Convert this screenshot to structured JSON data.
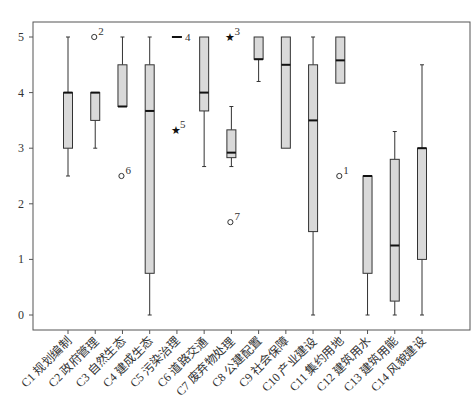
{
  "chart_data": {
    "type": "boxplot",
    "title": "",
    "xlabel": "",
    "ylabel": "",
    "ylim": [
      0,
      5
    ],
    "yticks": [
      0,
      1,
      2,
      3,
      4,
      5
    ],
    "grid": false,
    "legend": null,
    "categories": [
      "C1 规划编制",
      "C2 政府管理",
      "C3 自然生态",
      "C4 建成生态",
      "C5 污染治理",
      "C6 道路交通",
      "C7 废弃物处理",
      "C8 公建配置",
      "C9 社会保障",
      "C10 产业建设",
      "C11 集约用地",
      "C12 建筑用水",
      "C13 建筑用能",
      "C14 风貌建设"
    ],
    "boxes": [
      {
        "min": 2.5,
        "q1": 3.0,
        "median": 4.0,
        "q3": 4.0,
        "max": 5.0,
        "outliers": []
      },
      {
        "min": 3.0,
        "q1": 3.5,
        "median": 4.0,
        "q3": 4.0,
        "max": 4.0,
        "outliers": [
          {
            "value": 5.0,
            "marker": "circle",
            "label": "2"
          }
        ]
      },
      {
        "min": 3.75,
        "q1": 3.75,
        "median": 3.75,
        "q3": 4.5,
        "max": 5.0,
        "outliers": [
          {
            "value": 2.5,
            "marker": "circle",
            "label": "6"
          }
        ]
      },
      {
        "min": 0.0,
        "q1": 0.75,
        "median": 3.67,
        "q3": 4.5,
        "max": 5.0,
        "outliers": []
      },
      {
        "min": 5.0,
        "q1": 5.0,
        "median": 5.0,
        "q3": 5.0,
        "max": 5.0,
        "label": "4",
        "outliers": [
          {
            "value": 3.33,
            "marker": "star",
            "label": "5"
          }
        ]
      },
      {
        "min": 2.67,
        "q1": 3.67,
        "median": 4.0,
        "q3": 5.0,
        "max": 5.0,
        "outliers": []
      },
      {
        "min": 2.67,
        "q1": 2.83,
        "median": 2.92,
        "q3": 3.33,
        "max": 3.75,
        "outliers": [
          {
            "value": 5.0,
            "marker": "star",
            "label": "3"
          },
          {
            "value": 1.67,
            "marker": "circle",
            "label": "7"
          }
        ]
      },
      {
        "min": 4.2,
        "q1": 4.6,
        "median": 4.6,
        "q3": 5.0,
        "max": 5.0,
        "outliers": []
      },
      {
        "min": 3.0,
        "q1": 3.0,
        "median": 4.5,
        "q3": 5.0,
        "max": 5.0,
        "outliers": []
      },
      {
        "min": 0.0,
        "q1": 1.5,
        "median": 3.5,
        "q3": 4.5,
        "max": 5.0,
        "outliers": []
      },
      {
        "min": 4.17,
        "q1": 4.17,
        "median": 4.58,
        "q3": 5.0,
        "max": 5.0,
        "outliers": [
          {
            "value": 2.5,
            "marker": "circle",
            "label": "1"
          }
        ]
      },
      {
        "min": 0.0,
        "q1": 0.75,
        "median": 2.5,
        "q3": 2.5,
        "max": 2.5,
        "outliers": []
      },
      {
        "min": 0.0,
        "q1": 0.25,
        "median": 1.25,
        "q3": 2.8,
        "max": 3.3,
        "outliers": []
      },
      {
        "min": 0.0,
        "q1": 1.0,
        "median": 3.0,
        "q3": 3.0,
        "max": 4.5,
        "outliers": []
      }
    ],
    "colors": {
      "box_fill": "#d9d9d9",
      "box_stroke": "#333333",
      "median": "#111111",
      "axis": "#555555"
    }
  }
}
